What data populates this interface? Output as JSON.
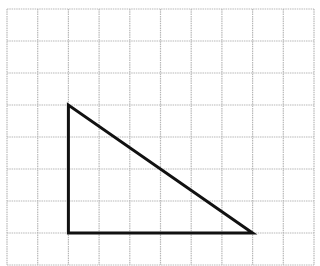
{
  "diagram": {
    "type": "grid-figure",
    "grid": {
      "columns": 10,
      "rows": 8,
      "line_color": "#b8b8b8",
      "line_style": "dotted"
    },
    "shape": {
      "name": "right-triangle",
      "vertices_grid_units": [
        [
          2,
          3
        ],
        [
          2,
          7
        ],
        [
          8,
          7
        ]
      ],
      "stroke_color": "#111111",
      "legs_grid_units": {
        "vertical": 4,
        "horizontal": 6
      }
    }
  }
}
